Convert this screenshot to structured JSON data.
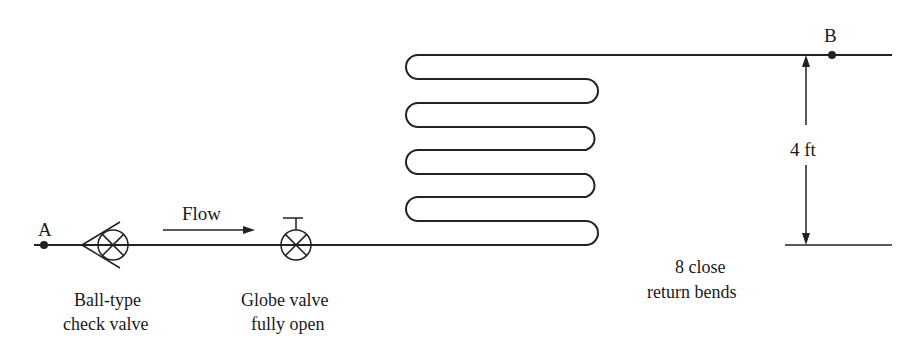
{
  "diagram": {
    "points": [
      {
        "id": "A",
        "label": "A"
      },
      {
        "id": "B",
        "label": "B"
      }
    ],
    "flow_label": "Flow",
    "components": [
      {
        "id": "check-valve",
        "line1": "Ball-type",
        "line2": "check valve"
      },
      {
        "id": "globe-valve",
        "line1": "Globe valve",
        "line2": "fully open"
      },
      {
        "id": "return-bends",
        "line1": "8 close",
        "line2": "return bends"
      }
    ],
    "dimension": {
      "label": "4 ft"
    },
    "colors": {
      "line": "#222222",
      "background": "#ffffff"
    }
  }
}
